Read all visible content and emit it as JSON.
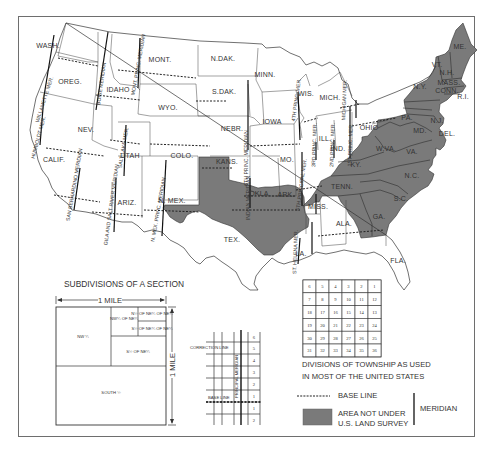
{
  "map": {
    "unsurveyed_color": "#7a7a7a",
    "line_color": "#333333",
    "states": [
      {
        "abbr": "WASH.",
        "x": 48,
        "y": 48
      },
      {
        "abbr": "OREG.",
        "x": 70,
        "y": 84
      },
      {
        "abbr": "CALIF.",
        "x": 54,
        "y": 162
      },
      {
        "abbr": "NEV.",
        "x": 86,
        "y": 132
      },
      {
        "abbr": "IDAHO",
        "x": 118,
        "y": 92
      },
      {
        "abbr": "MONT.",
        "x": 160,
        "y": 62
      },
      {
        "abbr": "WYO.",
        "x": 168,
        "y": 110
      },
      {
        "abbr": "UTAH",
        "x": 130,
        "y": 158
      },
      {
        "abbr": "COLO.",
        "x": 182,
        "y": 158
      },
      {
        "abbr": "ARIZ.",
        "x": 127,
        "y": 205
      },
      {
        "abbr": "N. MEX.",
        "x": 172,
        "y": 203
      },
      {
        "abbr": "N.DAK.",
        "x": 223,
        "y": 61
      },
      {
        "abbr": "S.DAK.",
        "x": 224,
        "y": 94
      },
      {
        "abbr": "NEBR.",
        "x": 232,
        "y": 131
      },
      {
        "abbr": "KANS.",
        "x": 227,
        "y": 164
      },
      {
        "abbr": "OKLA.",
        "x": 260,
        "y": 196
      },
      {
        "abbr": "TEX.",
        "x": 232,
        "y": 242
      },
      {
        "abbr": "MINN.",
        "x": 265,
        "y": 77
      },
      {
        "abbr": "IOWA",
        "x": 272,
        "y": 124
      },
      {
        "abbr": "MO.",
        "x": 287,
        "y": 162
      },
      {
        "abbr": "ARK.",
        "x": 286,
        "y": 197
      },
      {
        "abbr": "LA.",
        "x": 301,
        "y": 256
      },
      {
        "abbr": "WIS.",
        "x": 306,
        "y": 96
      },
      {
        "abbr": "MICH.",
        "x": 330,
        "y": 100
      },
      {
        "abbr": "ILL.",
        "x": 325,
        "y": 141
      },
      {
        "abbr": "IND.",
        "x": 338,
        "y": 151
      },
      {
        "abbr": "OHIO",
        "x": 369,
        "y": 130
      },
      {
        "abbr": "MISS.",
        "x": 318,
        "y": 209
      },
      {
        "abbr": "ALA.",
        "x": 344,
        "y": 226
      },
      {
        "abbr": "FLA.",
        "x": 398,
        "y": 263
      },
      {
        "abbr": "KY.",
        "x": 356,
        "y": 167
      },
      {
        "abbr": "TENN.",
        "x": 342,
        "y": 189
      },
      {
        "abbr": "GA.",
        "x": 379,
        "y": 219
      },
      {
        "abbr": "S.C.",
        "x": 401,
        "y": 201
      },
      {
        "abbr": "N.C.",
        "x": 412,
        "y": 178
      },
      {
        "abbr": "VA.",
        "x": 412,
        "y": 154
      },
      {
        "abbr": "W.VA.",
        "x": 386,
        "y": 151
      },
      {
        "abbr": "MD.",
        "x": 420,
        "y": 133
      },
      {
        "abbr": "DEL.",
        "x": 447,
        "y": 136
      },
      {
        "abbr": "PA.",
        "x": 407,
        "y": 120
      },
      {
        "abbr": "N.J.",
        "x": 437,
        "y": 123
      },
      {
        "abbr": "N.Y.",
        "x": 420,
        "y": 89
      },
      {
        "abbr": "VT.",
        "x": 437,
        "y": 67
      },
      {
        "abbr": "N.H.",
        "x": 447,
        "y": 75
      },
      {
        "abbr": "MASS.",
        "x": 449,
        "y": 85
      },
      {
        "abbr": "CONN.",
        "x": 447,
        "y": 93
      },
      {
        "abbr": "R.I.",
        "x": 463,
        "y": 99
      },
      {
        "abbr": "ME.",
        "x": 460,
        "y": 49
      }
    ],
    "meridians": [
      {
        "label": "WILLAMETTE MER.",
        "x": 46,
        "y": 100,
        "rot": -72
      },
      {
        "label": "HUMBOLDT MER.",
        "x": 40,
        "y": 138,
        "rot": -75
      },
      {
        "label": "BOISE MERIDIAN",
        "x": 103,
        "y": 84,
        "rot": -82
      },
      {
        "label": "MONT. PRINC. MERIDIAN",
        "x": 140,
        "y": 65,
        "rot": -80
      },
      {
        "label": "SALT LAKE MER.",
        "x": 125,
        "y": 148,
        "rot": -80
      },
      {
        "label": "SAN BERNARDINO MERIDIAN",
        "x": 76,
        "y": 185,
        "rot": -80
      },
      {
        "label": "GILA AND SALT RIVER MERIDIAN",
        "x": 113,
        "y": 205,
        "rot": -82
      },
      {
        "label": "N. MEX. PRINC. MERIDIAN",
        "x": 160,
        "y": 210,
        "rot": -80
      },
      {
        "label": "6TH PRINC. MERIDIAN",
        "x": 248,
        "y": 158,
        "rot": -90
      },
      {
        "label": "INDIAN MERIDIAN",
        "x": 250,
        "y": 198,
        "rot": -90
      },
      {
        "label": "5TH PRINCIPAL MER.",
        "x": 303,
        "y": 185,
        "rot": -82
      },
      {
        "label": "4TH PRINC. MER.",
        "x": 298,
        "y": 100,
        "rot": -82
      },
      {
        "label": "3RD PRINC. MER.",
        "x": 316,
        "y": 145,
        "rot": -88
      },
      {
        "label": "2ND PRINC. MER.",
        "x": 334,
        "y": 145,
        "rot": -88
      },
      {
        "label": "1ST PRINC. MER.",
        "x": 352,
        "y": 145,
        "rot": -88
      },
      {
        "label": "MICHIGAN MER.",
        "x": 346,
        "y": 100,
        "rot": -88
      },
      {
        "label": "ST. HELENA MER.",
        "x": 297,
        "y": 252,
        "rot": -88
      }
    ]
  },
  "section_diagram": {
    "title": "SUBDIVISIONS OF A SECTION",
    "width_label": "1 MILE",
    "height_label": "1 MILE",
    "cells": {
      "nw_quarter": "NW ¼",
      "nw_of_ne": "NW¼ OF NE¼",
      "n_half_ne_ne": "N½ OF NE¼ OF NE¼",
      "s_half_ne_ne": "S½ OF NE¼ OF NE¼",
      "s_half_of_ne": "S½ OF NE¼",
      "south_half": "SOUTH ½"
    }
  },
  "township_diagram": {
    "correction_line": "CORRECTION LINE",
    "base_line": "BASE LINE",
    "principal_meridian": "PRINCIPAL MERIDIAN",
    "range_numbers_above": [
      "6",
      "5",
      "4",
      "3",
      "2",
      "1"
    ],
    "range_numbers_below": [
      "1",
      "2"
    ]
  },
  "township_grid": {
    "rows": [
      [
        "6",
        "5",
        "4",
        "3",
        "2",
        "1"
      ],
      [
        "7",
        "8",
        "9",
        "10",
        "11",
        "12"
      ],
      [
        "18",
        "17",
        "16",
        "15",
        "14",
        "13"
      ],
      [
        "19",
        "20",
        "21",
        "22",
        "23",
        "24"
      ],
      [
        "30",
        "29",
        "28",
        "27",
        "26",
        "25"
      ],
      [
        "31",
        "32",
        "33",
        "34",
        "35",
        "36"
      ]
    ],
    "caption_line1": "DIVISIONS OF TOWNSHIP AS USED",
    "caption_line2": "IN MOST OF THE UNITED STATES"
  },
  "legend": {
    "base_line": "BASE LINE",
    "not_surveyed_line1": "AREA NOT UNDER",
    "not_surveyed_line2": "U.S. LAND SURVEY",
    "meridian": "MERIDIAN"
  }
}
